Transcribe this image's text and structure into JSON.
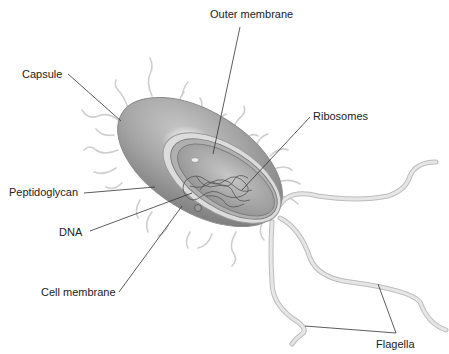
{
  "diagram": {
    "labels": {
      "outer_membrane": "Outer membrane",
      "capsule": "Capsule",
      "ribosomes": "Ribosomes",
      "peptidoglycan": "Peptidoglycan",
      "dna": "DNA",
      "cell_membrane": "Cell membrane",
      "flagella": "Flagella"
    },
    "colors": {
      "background": "#ffffff",
      "cell_body": "#9a9a9a",
      "cell_interior": "#b8b8b8",
      "flagella": "#d4d4d4",
      "leader_lines": "#333333",
      "text": "#222222"
    }
  }
}
